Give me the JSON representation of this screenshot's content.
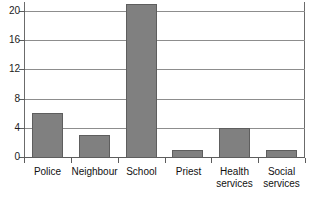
{
  "chart_data": {
    "type": "bar",
    "title": "",
    "subtitle": "",
    "xlabel": "",
    "ylabel": "",
    "categories": [
      "Police",
      "Neighbour",
      "School",
      "Priest",
      "Health services",
      "Social services"
    ],
    "category_lines": [
      [
        "Police"
      ],
      [
        "Neighbour"
      ],
      [
        "School"
      ],
      [
        "Priest"
      ],
      [
        "Health",
        "services"
      ],
      [
        "Social",
        "services"
      ]
    ],
    "values": [
      6,
      3,
      21,
      1,
      4,
      1
    ],
    "ylim": [
      0,
      22
    ],
    "ytick_labels": [
      "0",
      "4",
      "8",
      "12",
      "16",
      "20"
    ],
    "ytick_values": [
      0,
      4,
      8,
      12,
      16,
      20
    ],
    "grid": "horizontal",
    "legend": "none",
    "colors": {
      "bar_fill": "#808080",
      "bar_edge": "#5e5e5e",
      "gridline": "#8d8d8d",
      "axis": "#5c5c5c",
      "text": "#111111",
      "background": "#ffffff"
    }
  }
}
